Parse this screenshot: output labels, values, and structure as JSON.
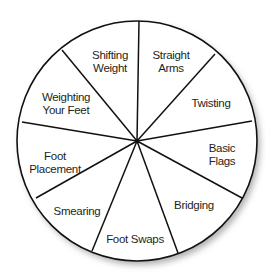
{
  "diagram": {
    "type": "pie-wheel",
    "center": [
      137,
      141
    ],
    "radius": 120,
    "colors": {
      "stroke": "#111111",
      "fill": "#ffffff",
      "text": "#231f20",
      "shadow": "#bdbdbd"
    },
    "spokes": [
      [
        139,
        21
      ],
      [
        215,
        54
      ],
      [
        252,
        121
      ],
      [
        242,
        198
      ],
      [
        178,
        253
      ],
      [
        92,
        251
      ],
      [
        36,
        198
      ],
      [
        22,
        122
      ],
      [
        62,
        50
      ]
    ],
    "segments": [
      {
        "label": "Shifting\nWeight",
        "x": 110,
        "y": 62
      },
      {
        "label": "Straight\nArms",
        "x": 171,
        "y": 62
      },
      {
        "label": "Twisting",
        "x": 211,
        "y": 103
      },
      {
        "label": "Basic Flags",
        "x": 222,
        "y": 155
      },
      {
        "label": "Bridging",
        "x": 194,
        "y": 205
      },
      {
        "label": "Foot Swaps",
        "x": 135,
        "y": 239
      },
      {
        "label": "Smearing",
        "x": 77,
        "y": 211
      },
      {
        "label": "Foot\nPlacement",
        "x": 55,
        "y": 163
      },
      {
        "label": "Weighting\nYour Feet",
        "x": 66,
        "y": 104
      }
    ]
  }
}
